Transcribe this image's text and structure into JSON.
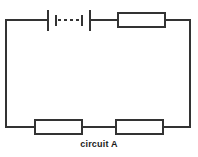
{
  "diagram": {
    "title": "circuit A",
    "caption": "circuit A",
    "type": "electrical-circuit-schematic",
    "background_color": "#ffffff",
    "line_color": "#333333",
    "stroke_width": 2,
    "loop": {
      "left_x": 6,
      "right_x": 190,
      "top_y": 20,
      "bottom_y": 127
    },
    "components": [
      {
        "id": "battery-1",
        "name": "battery",
        "symbol": "multi-cell-battery",
        "position": "top-left",
        "label": "",
        "x": 46,
        "y": 20,
        "width": 46,
        "height": 20,
        "cells": 2,
        "dashed_gap": true
      },
      {
        "id": "resistor-top",
        "name": "resistor",
        "symbol": "resistor-box",
        "position": "top-right",
        "label": "",
        "x": 118,
        "y": 13,
        "width": 47,
        "height": 14
      },
      {
        "id": "resistor-bottom-left",
        "name": "resistor",
        "symbol": "resistor-box",
        "position": "bottom-left",
        "label": "",
        "x": 35,
        "y": 120,
        "width": 47,
        "height": 14
      },
      {
        "id": "resistor-bottom-right",
        "name": "resistor",
        "symbol": "resistor-box",
        "position": "bottom-right",
        "label": "",
        "x": 116,
        "y": 120,
        "width": 47,
        "height": 14
      }
    ]
  }
}
